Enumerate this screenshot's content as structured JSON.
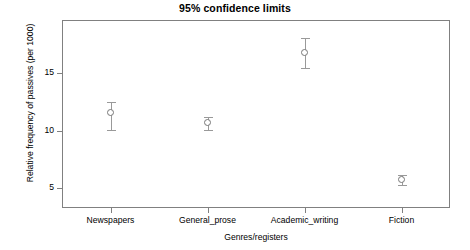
{
  "chart_data": {
    "type": "scatter",
    "title": "95% confidence limits",
    "xlabel": "Genres/registers",
    "ylabel": "Relative frequency of passives (per 1000)",
    "grid": false,
    "legend": "none",
    "categories": [
      "Newspapers",
      "General_prose",
      "Academic_writing",
      "Fiction"
    ],
    "values": [
      11.5,
      10.65,
      16.7,
      5.7
    ],
    "ci_lower": [
      10.1,
      10.1,
      15.4,
      5.3
    ],
    "ci_upper": [
      12.5,
      11.2,
      18.0,
      6.2
    ],
    "series": [
      {
        "name": "Mean with 95% CI",
        "points": [
          {
            "category": "Newspapers",
            "mean": 11.5,
            "lower": 10.1,
            "upper": 12.5
          },
          {
            "category": "General_prose",
            "mean": 10.65,
            "lower": 10.1,
            "upper": 11.2
          },
          {
            "category": "Academic_writing",
            "mean": 16.7,
            "lower": 15.4,
            "upper": 18.0
          },
          {
            "category": "Fiction",
            "mean": 5.7,
            "lower": 5.3,
            "upper": 6.2
          }
        ]
      }
    ],
    "ytick_labels": [
      "15",
      "10",
      "5"
    ],
    "ytick_values": [
      15,
      10,
      5
    ],
    "ylim": [
      3.3,
      19.6
    ],
    "xlim": [
      0.5,
      4.5
    ]
  },
  "colors": {
    "axis": "#808080",
    "marker": "#777777",
    "errorbar": "#999999",
    "text": "#000000",
    "background": "#ffffff"
  }
}
